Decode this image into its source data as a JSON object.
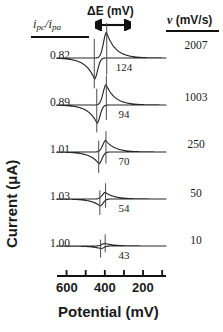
{
  "figure": {
    "type": "cyclic-voltammogram-stack",
    "axis_labels": {
      "x": "Potential (mV)",
      "y": "Current (μA)"
    },
    "column_headers": {
      "ratio_i": "i",
      "ratio_sub_pc": "pc",
      "ratio_slash": "/",
      "ratio_i2": "i",
      "ratio_sub_pa": "pa",
      "delta_e": "ΔE (mV)",
      "scan_rate": "ν (mV/s)"
    },
    "xaxis": {
      "ticks": [
        600,
        500,
        400,
        300,
        200,
        100
      ],
      "labeled_ticks": [
        "600",
        "400",
        "200"
      ],
      "direction": "decreasing-left-to-right",
      "range_mv": [
        650,
        80
      ]
    },
    "colors": {
      "trace": "#262626",
      "axis": "#111111",
      "text": "#1a1a1a"
    }
  },
  "chart_data": {
    "type": "line",
    "title": "",
    "xlabel": "Potential (mV)",
    "ylabel": "Current (μA)",
    "xlim": [
      650,
      80
    ],
    "grid": false,
    "legend": "none",
    "xticks": [
      600,
      500,
      400,
      300,
      200,
      100
    ],
    "xticklabels": [
      "600",
      "",
      "400",
      "",
      "200",
      ""
    ],
    "series": [
      {
        "name": "2007 mV/s",
        "scan_rate_mv_s": 2007,
        "peak_separation_mv": 124,
        "ipc_over_ipa": 0.82,
        "epa_mv": 390,
        "epc_mv": 455,
        "amplitude": 1.0
      },
      {
        "name": "1003 mV/s",
        "scan_rate_mv_s": 1003,
        "peak_separation_mv": 94,
        "ipc_over_ipa": 0.89,
        "epa_mv": 392,
        "epc_mv": 442,
        "amplitude": 0.86
      },
      {
        "name": "250 mV/s",
        "scan_rate_mv_s": 250,
        "peak_separation_mv": 70,
        "ipc_over_ipa": 1.01,
        "epa_mv": 394,
        "epc_mv": 432,
        "amplitude": 0.62
      },
      {
        "name": "50 mV/s",
        "scan_rate_mv_s": 50,
        "peak_separation_mv": 54,
        "ipc_over_ipa": 1.03,
        "epa_mv": 396,
        "epc_mv": 426,
        "amplitude": 0.45
      },
      {
        "name": "10 mV/s",
        "scan_rate_mv_s": 10,
        "peak_separation_mv": 43,
        "ipc_over_ipa": 1.0,
        "epa_mv": 398,
        "epc_mv": 422,
        "amplitude": 0.26
      }
    ]
  },
  "rows": [
    {
      "ratio": "0.82",
      "delta_e": "124",
      "rate": "2007"
    },
    {
      "ratio": "0.89",
      "delta_e": "94",
      "rate": "1003"
    },
    {
      "ratio": "1.01",
      "delta_e": "70",
      "rate": "250"
    },
    {
      "ratio": "1.03",
      "delta_e": "54",
      "rate": "50"
    },
    {
      "ratio": "1.00",
      "delta_e": "43",
      "rate": "10"
    }
  ],
  "xtick_labels": [
    {
      "text": "600"
    },
    {
      "text": "400"
    },
    {
      "text": "200"
    }
  ]
}
